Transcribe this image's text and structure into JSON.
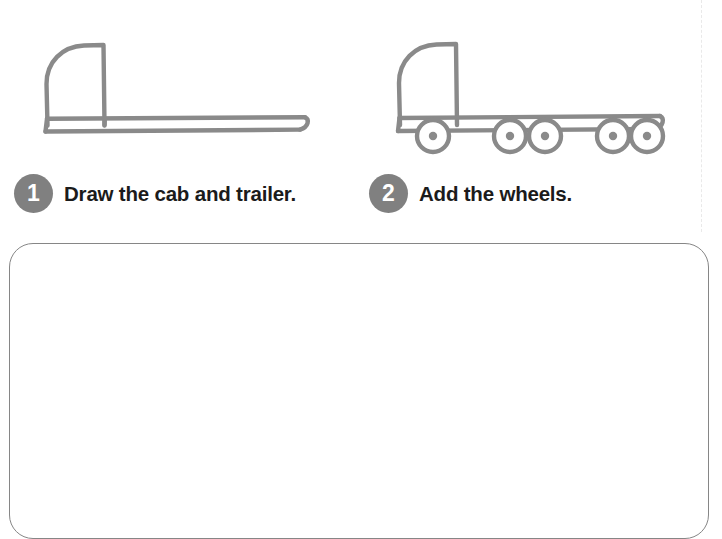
{
  "page": {
    "background_color": "#ffffff",
    "stroke_color": "#8a8a8a",
    "badge_color": "#808080",
    "text_color": "#1b1b1b",
    "box_border_color": "#868686"
  },
  "steps": [
    {
      "number": "1",
      "caption": "Draw the cab and trailer.",
      "illustration": "truck-cab-and-trailer-outline"
    },
    {
      "number": "2",
      "caption": "Add the wheels.",
      "illustration": "truck-with-five-wheels-outline"
    }
  ],
  "drawing_area": {
    "label": "blank-practice-drawing-box",
    "content": ""
  }
}
